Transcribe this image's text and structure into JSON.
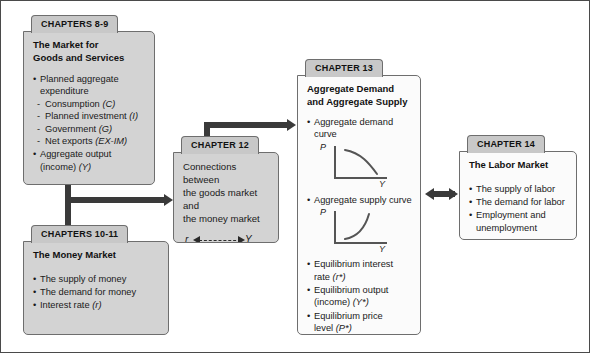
{
  "diagram": {
    "colors": {
      "tab_fill": "#c8c8c8",
      "box_gray_fill": "#d3d3d3",
      "box_white_fill": "#fbfbfb",
      "border": "#6e6e6e",
      "arrow": "#3a3a3a",
      "frame": "#4a4a4a"
    }
  },
  "ch89": {
    "tab": "CHAPTERS 8-9",
    "heading_line1": "The Market for",
    "heading_line2": "Goods and Services",
    "items": [
      "Planned aggregate",
      "expenditure"
    ],
    "subitems": [
      {
        "text": "Consumption ",
        "sym": "(C)"
      },
      {
        "text": "Planned investment ",
        "sym": "(I)"
      },
      {
        "text": "Government ",
        "sym": "(G)"
      },
      {
        "text": "Net exports ",
        "sym": "(EX-IM)"
      }
    ],
    "last_item": "Aggregate output",
    "last_cont": "(income) ",
    "last_sym": "(Y)"
  },
  "ch1011": {
    "tab": "CHAPTERS 10-11",
    "heading": "The Money Market",
    "items": [
      {
        "text": "The supply of money",
        "sym": ""
      },
      {
        "text": "The demand for money",
        "sym": ""
      },
      {
        "text": "Interest rate ",
        "sym": "(r)"
      }
    ]
  },
  "ch12": {
    "tab": "CHAPTER 12",
    "text_line1": "Connections between",
    "text_line2": "the goods market and",
    "text_line3": "the money market",
    "relation_left": "r",
    "relation_right": "Y",
    "relation_full": "r <--> Y"
  },
  "ch13": {
    "tab": "CHAPTER 13",
    "heading_line1": "Aggregate Demand",
    "heading_line2": "and Aggregate Supply",
    "bullet_ad": "Aggregate demand curve",
    "graph_ad": {
      "y_axis": "P",
      "x_axis": "Y",
      "shape": "downward-sloping convex"
    },
    "bullet_as": "Aggregate supply curve",
    "graph_as": {
      "y_axis": "P",
      "x_axis": "Y",
      "shape": "upward-sloping convex"
    },
    "items": [
      {
        "text": "Equilibrium interest",
        "cont": "rate ",
        "sym": "(r*)"
      },
      {
        "text": "Equilibrium output",
        "cont": "(income) ",
        "sym": "(Y*)"
      },
      {
        "text": "Equilibrium price",
        "cont": "level ",
        "sym": "(P*)"
      }
    ]
  },
  "ch14": {
    "tab": "CHAPTER 14",
    "heading": "The Labor Market",
    "items": [
      {
        "text": "The supply of labor",
        "cont": ""
      },
      {
        "text": "The demand for labor",
        "cont": ""
      },
      {
        "text": "Employment and",
        "cont": "unemployment"
      }
    ]
  },
  "connectors": {
    "spine_label": "vertical-connector-chapters-8-9-to-10-11",
    "arm_label": "arrow-to-chapter-12",
    "up_right_label": "arrow-chapter-12-to-chapter-13",
    "double_label": "double-arrow-chapter-13-chapter-14"
  }
}
